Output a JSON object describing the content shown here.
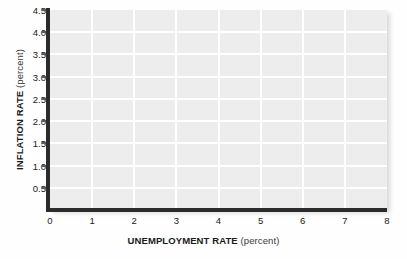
{
  "chart_data": {
    "type": "line",
    "title": "",
    "subtitle": "",
    "xlabel_bold": "UNEMPLOYMENT RATE",
    "xlabel_unit": "(percent)",
    "ylabel_bold": "INFLATION RATE",
    "ylabel_unit": "(percent)",
    "xlim": [
      0,
      8
    ],
    "ylim": [
      0,
      4.5
    ],
    "x_ticks": [
      0,
      1,
      2,
      3,
      4,
      5,
      6,
      7,
      8
    ],
    "x_tick_labels": [
      "0",
      "1",
      "2",
      "3",
      "4",
      "5",
      "6",
      "7",
      "8"
    ],
    "y_ticks": [
      0.5,
      1.0,
      1.5,
      2.0,
      2.5,
      3.0,
      3.5,
      4.0,
      4.5
    ],
    "y_tick_labels": [
      "0.5",
      "1.0",
      "1.5",
      "2.0",
      "2.5",
      "3.0",
      "3.5",
      "4.0",
      "4.5"
    ],
    "grid": true,
    "grid_color": "#ffffff",
    "plot_background": "#ededed",
    "axis_color": "#2b2b2b",
    "legend": [],
    "series": [],
    "annotations": [],
    "note": "empty grid - no data plotted"
  },
  "figure": {
    "background": "#fefefe"
  }
}
